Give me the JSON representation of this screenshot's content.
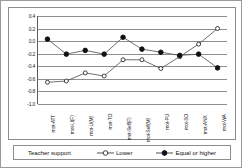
{
  "chart_data": {
    "type": "line",
    "title": "",
    "xlabel": "",
    "ylabel": "",
    "ylim": [
      -1.0,
      0.4
    ],
    "grid": true,
    "legend_position": "bottom",
    "legend_title": "Teacher support",
    "categories": [
      "mot-ATT",
      "mot-LI(F)",
      "mot-LI(M)",
      "mot-TO",
      "mot-Self(F)",
      "mot-Self(M)",
      "mot-PU",
      "mot-SO",
      "mot-ANX",
      "mot-WA"
    ],
    "ytick_labels": [
      "0.4",
      "0.2",
      "0.0",
      "-0.2",
      "-0.4",
      "-0.6",
      "-0.8",
      "-1.0"
    ],
    "ytick_values": [
      0.4,
      0.2,
      0.0,
      -0.2,
      -0.4,
      -0.6,
      -0.8,
      -1.0
    ],
    "series": [
      {
        "name": "Lower",
        "marker": "open-circle",
        "values": [
          -0.66,
          -0.64,
          -0.51,
          -0.56,
          -0.3,
          -0.3,
          -0.44,
          -0.25,
          -0.05,
          0.2
        ]
      },
      {
        "name": "Equal or higher",
        "marker": "filled-circle",
        "values": [
          0.03,
          -0.21,
          -0.15,
          -0.21,
          0.06,
          -0.13,
          -0.18,
          -0.23,
          -0.21,
          -0.43
        ]
      }
    ]
  },
  "legend": {
    "title": "Teacher support",
    "entries": [
      {
        "label": "Lower",
        "marker": "open-circle"
      },
      {
        "label": "Equal or higher",
        "marker": "filled-circle"
      }
    ]
  }
}
